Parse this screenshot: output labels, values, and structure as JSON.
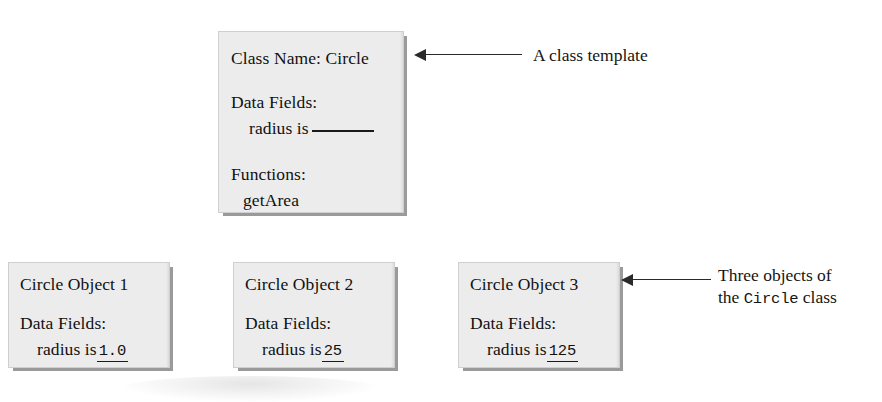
{
  "figure": {
    "background_color": "#ffffff",
    "box_fill_color": "#ececec",
    "box_shadow_color": "#9a9a9a",
    "text_color": "#111111"
  },
  "class_template": {
    "class_name_line": "Class Name: Circle",
    "data_fields_heading": "Data Fields:",
    "radius_label": "radius is",
    "radius_value": "",
    "functions_heading": "Functions:",
    "function_name": "getArea"
  },
  "annotations": {
    "template": {
      "text": "A class template",
      "arrow_direction": "left"
    },
    "objects": {
      "line1": "Three objects of",
      "line2_prefix": "the ",
      "line2_mono": "Circle",
      "line2_suffix": " class",
      "arrow_direction": "left"
    }
  },
  "objects": [
    {
      "title": "Circle Object 1",
      "data_fields_heading": "Data Fields:",
      "radius_label": "radius is",
      "radius_value": "1.0"
    },
    {
      "title": "Circle Object 2",
      "data_fields_heading": "Data Fields:",
      "radius_label": "radius is",
      "radius_value": "25"
    },
    {
      "title": "Circle Object 3",
      "data_fields_heading": "Data Fields:",
      "radius_label": "radius is",
      "radius_value": "125"
    }
  ]
}
